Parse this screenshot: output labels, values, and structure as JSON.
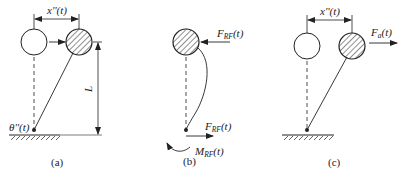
{
  "panels": [
    {
      "id": "a",
      "caption": "(a)",
      "labels": {
        "displacement": "x''(t)",
        "rotation": "θ''(t)",
        "length": "L"
      }
    },
    {
      "id": "b",
      "caption": "(b)",
      "labels": {
        "top_force_main": "F",
        "top_force_sub": "RF",
        "top_force_arg": "(t)",
        "base_force_main": "F",
        "base_force_sub": "RF",
        "base_force_arg": "(t)",
        "base_moment_main": "M",
        "base_moment_sub": "RF",
        "base_moment_arg": "(t)"
      }
    },
    {
      "id": "c",
      "caption": "(c)",
      "labels": {
        "displacement": "x''(t)",
        "applied_force_main": "F",
        "applied_force_sub": "a",
        "applied_force_arg": "(t)"
      }
    }
  ],
  "colors": {
    "stroke": "#222222",
    "background": "#ffffff"
  }
}
